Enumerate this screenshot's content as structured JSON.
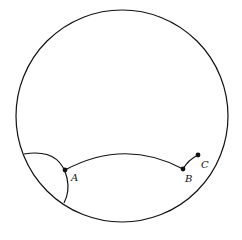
{
  "diagram": {
    "type": "hyperbolic-disk",
    "stroke_color": "#111111",
    "background": "#ffffff",
    "points": [
      {
        "label": "A",
        "x": 65,
        "y": 170
      },
      {
        "label": "B",
        "x": 183,
        "y": 169
      },
      {
        "label": "C",
        "x": 198,
        "y": 155
      }
    ]
  }
}
